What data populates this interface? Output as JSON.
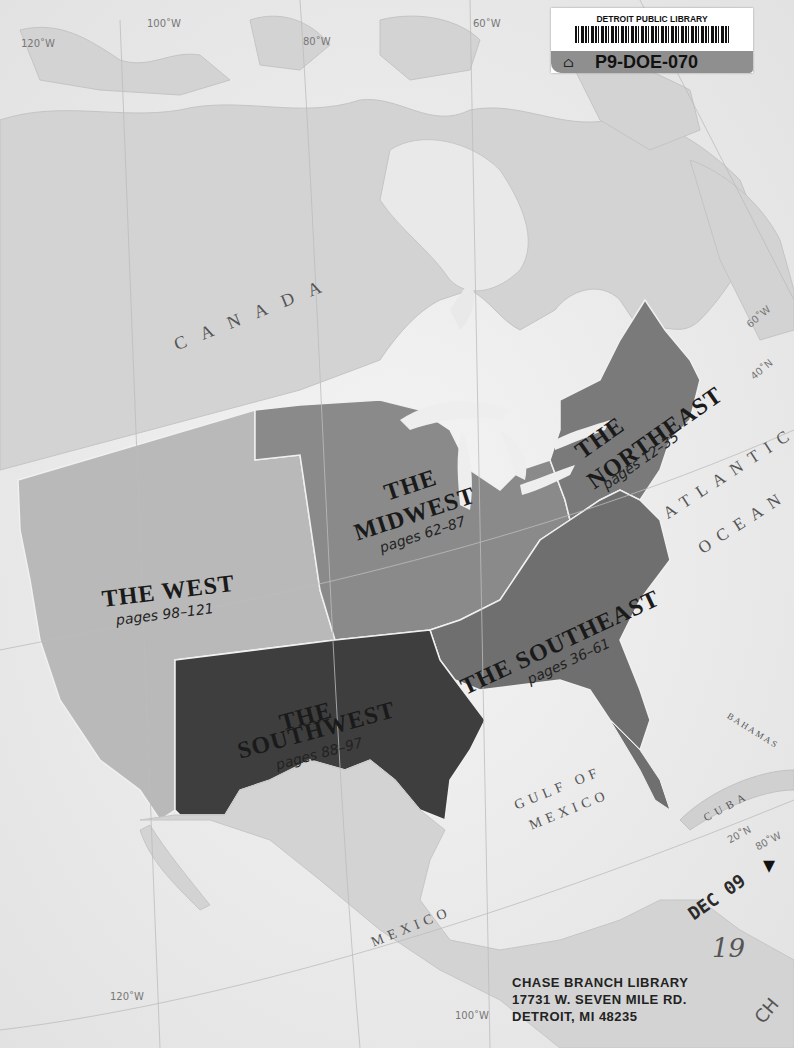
{
  "map": {
    "regions": [
      {
        "id": "west",
        "title": "THE WEST",
        "pages": "pages 98–121",
        "color": "#b9b9b9"
      },
      {
        "id": "midwest",
        "title_line1": "THE",
        "title_line2": "MIDWEST",
        "pages": "pages 62–87",
        "color": "#8a8a8a"
      },
      {
        "id": "northeast",
        "title_line1": "THE",
        "title_line2": "NORTHEAST",
        "pages": "pages 12–35",
        "color": "#7a7a7a"
      },
      {
        "id": "southeast",
        "title": "THE SOUTHEAST",
        "pages": "pages 36–61",
        "color": "#6f6f6f"
      },
      {
        "id": "southwest",
        "title_line1": "THE",
        "title_line2": "SOUTHWEST",
        "pages": "pages 88–97",
        "color": "#3e3e3e"
      }
    ],
    "geo_labels": {
      "canada": "CANADA",
      "atlantic": "ATLANTIC",
      "ocean": "OCEAN",
      "gulf_line1": "GULF OF",
      "gulf_line2": "MEXICO",
      "mexico": "MEXICO",
      "cuba": "CUBA",
      "bahamas": "BAHAMAS"
    },
    "graticule": {
      "w120_top": "120˚W",
      "w100_top": "100˚W",
      "w80_top": "80˚W",
      "w60_top": "60˚W",
      "w60_right": "60˚W",
      "n40": "40˚N",
      "n20": "20˚N",
      "w80_bottom": "80˚W",
      "w120_bottom": "120˚W",
      "w100_bottom": "100˚W"
    },
    "colors": {
      "water": "#ededed",
      "land": "#cfcfcf",
      "border": "#f5f5f5"
    }
  },
  "library_label": {
    "title": "DETROIT PUBLIC LIBRARY",
    "id": "P9-DOE-070"
  },
  "stamps": {
    "date": "DEC 09",
    "handwritten": "19",
    "initials": "CH",
    "address_line1": "CHASE BRANCH LIBRARY",
    "address_line2": "17731 W. SEVEN MILE RD.",
    "address_line3": "DETROIT, MI 48235"
  }
}
